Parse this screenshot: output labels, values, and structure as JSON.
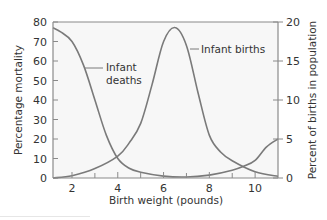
{
  "chart_data": {
    "type": "line",
    "title": "",
    "xlabel": "Birth weight (pounds)",
    "ylabel": "Percentage mortality",
    "y2label": "Percent of births in population",
    "xlim": [
      1.17,
      11.0
    ],
    "ylim": [
      0,
      80
    ],
    "y2lim": [
      0,
      20
    ],
    "x_ticks": [
      2,
      4,
      6,
      8,
      10
    ],
    "x_minor_ticks": [
      3,
      5,
      7,
      9
    ],
    "y_ticks": [
      0,
      10,
      20,
      30,
      40,
      50,
      60,
      70,
      80
    ],
    "y2_ticks": [
      0,
      5,
      10,
      15,
      20
    ],
    "grid": false,
    "legend": "inline annotations",
    "series": [
      {
        "name": "Infant deaths",
        "axis": "left",
        "x": [
          1.17,
          1.5,
          2,
          2.5,
          3,
          3.5,
          4,
          4.5,
          5,
          6,
          7,
          8,
          9,
          9.5,
          10,
          10.5,
          11
        ],
        "values": [
          77,
          75,
          70,
          58,
          40,
          22,
          10,
          5,
          3,
          1,
          0.5,
          1.5,
          4,
          6,
          9,
          16,
          20
        ]
      },
      {
        "name": "Infant births",
        "axis": "right",
        "x": [
          1.17,
          2,
          3,
          4,
          4.5,
          5,
          5.5,
          6,
          6.5,
          7,
          7.5,
          8,
          8.5,
          9,
          10,
          11
        ],
        "values": [
          0,
          0.3,
          1.2,
          2.8,
          4.5,
          7,
          12,
          17.5,
          19.3,
          17,
          11,
          5.5,
          3.3,
          2.2,
          0.8,
          0.2
        ]
      }
    ],
    "annotations": [
      {
        "text_lines": [
          "Infant",
          "deaths"
        ],
        "points_to_series": "Infant deaths"
      },
      {
        "text_lines": [
          "Infant births"
        ],
        "points_to_series": "Infant births"
      }
    ]
  },
  "labels": {
    "xlabel": "Birth weight (pounds)",
    "ylabel": "Percentage mortality",
    "y2label": "Percent of births in population",
    "deaths_line1": "Infant",
    "deaths_line2": "deaths",
    "births": "Infant births"
  },
  "colors": {
    "curve": "#7a7a7a",
    "axis": "#8a8a8a",
    "plot_bg": "#f7f7f7",
    "text": "#333333"
  }
}
